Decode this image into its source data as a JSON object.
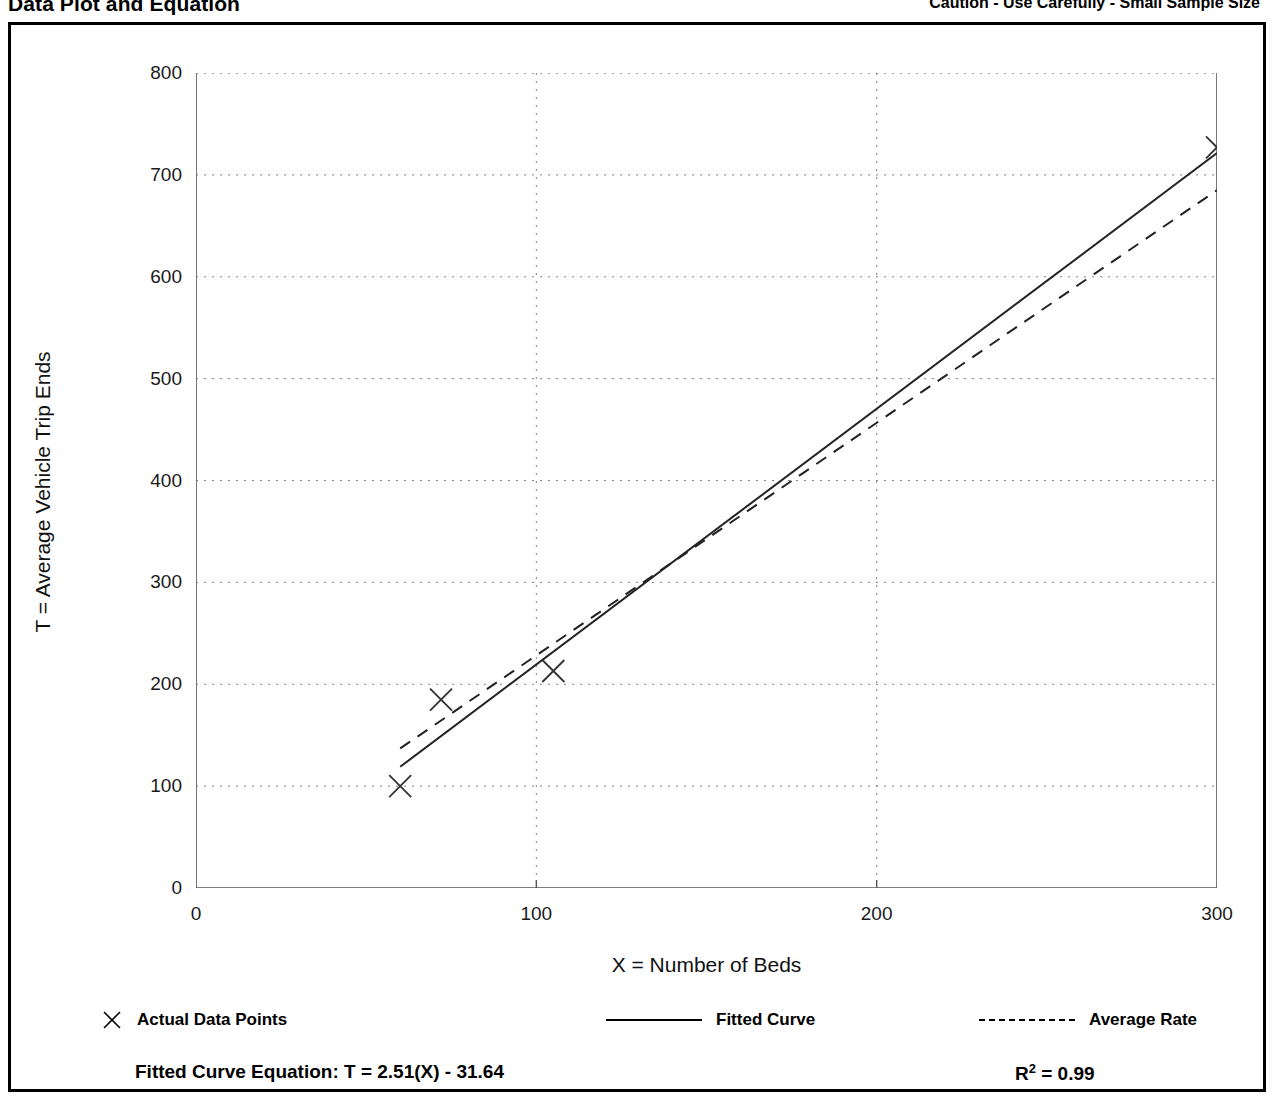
{
  "header": {
    "title": "Data Plot and Equation",
    "caution": "Caution - Use Carefully - Small Sample Size"
  },
  "legend": {
    "data_points_label": "Actual Data Points",
    "fitted_curve_label": "Fitted Curve",
    "average_rate_label": "Average Rate",
    "marker_glyph": "✕"
  },
  "equation": {
    "label": "Fitted Curve Equation:  T = 2.51(X) - 31.64",
    "r2_prefix": "R",
    "r2_exponent": "2",
    "r2_value": " = 0.99"
  },
  "chart_data": {
    "type": "scatter",
    "title": "Data Plot and Equation",
    "subtitle": "Caution - Use Carefully - Small Sample Size",
    "xlabel": "X = Number of Beds",
    "ylabel": "T = Average Vehicle Trip Ends",
    "xlim": [
      0,
      300
    ],
    "ylim": [
      0,
      800
    ],
    "xticks": [
      0,
      100,
      200,
      300
    ],
    "yticks": [
      0,
      100,
      200,
      300,
      400,
      500,
      600,
      700,
      800
    ],
    "x_minor_step": 50,
    "y_minor_step": 50,
    "grid": true,
    "grid_style": "dotted",
    "legend_position": "below-plot",
    "points": [
      {
        "x": 60,
        "y": 100
      },
      {
        "x": 72,
        "y": 185
      },
      {
        "x": 105,
        "y": 213
      },
      {
        "x": 300,
        "y": 727
      }
    ],
    "series": [
      {
        "name": "Fitted Curve",
        "style": "solid",
        "equation": "T = 2.51(X) - 31.64",
        "slope": 2.51,
        "intercept": -31.64,
        "r_squared": 0.99,
        "endpoints": [
          {
            "x": 60,
            "y": 119
          },
          {
            "x": 300,
            "y": 721.36
          }
        ]
      },
      {
        "name": "Average Rate",
        "style": "dashed",
        "slope": 2.2833,
        "intercept": 0,
        "endpoints": [
          {
            "x": 60,
            "y": 137
          },
          {
            "x": 300,
            "y": 685
          }
        ]
      }
    ]
  }
}
